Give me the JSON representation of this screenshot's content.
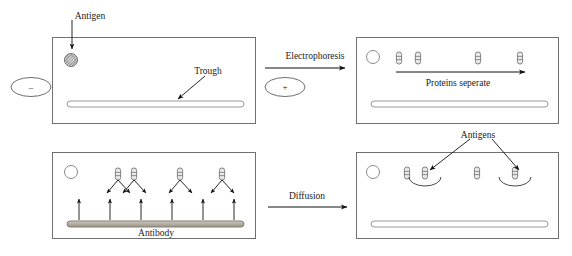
{
  "diagram": {
    "colors": {
      "stroke": "#3f3f3f",
      "panel_border": "#707070",
      "arrow": "#111111",
      "antibody_fill": "#b8b2a8",
      "well_fill": "#cfcfcf",
      "protein_fill": "#e8e8e8",
      "background": "#ffffff"
    },
    "panels": [
      {
        "id": "panel-top-left",
        "x": 52,
        "y": 37,
        "w": 203,
        "h": 86,
        "well": {
          "cx": 71,
          "cy": 60,
          "r": 6.5,
          "style": "hatched"
        },
        "trough": {
          "x": 67,
          "y": 101,
          "w": 177,
          "h": 6,
          "fill": "none"
        },
        "proteins": [],
        "arcs": []
      },
      {
        "id": "panel-top-right",
        "x": 356,
        "y": 37,
        "w": 202,
        "h": 86,
        "well": {
          "cx": 373,
          "cy": 57,
          "r": 6.5,
          "style": "plain"
        },
        "trough": {
          "x": 371,
          "y": 101,
          "w": 177,
          "h": 6,
          "fill": "none"
        },
        "proteins": [
          {
            "cx": 399,
            "cy": 58
          },
          {
            "cx": 418,
            "cy": 58
          },
          {
            "cx": 478,
            "cy": 58
          },
          {
            "cx": 520,
            "cy": 58
          }
        ],
        "arcs": []
      },
      {
        "id": "panel-bottom-left",
        "x": 52,
        "y": 152,
        "w": 203,
        "h": 86,
        "well": {
          "cx": 71,
          "cy": 172,
          "r": 6.5,
          "style": "plain"
        },
        "trough": {
          "x": 67,
          "y": 221,
          "w": 177,
          "h": 6,
          "fill": "antibody"
        },
        "proteins": [
          {
            "cx": 118,
            "cy": 174
          },
          {
            "cx": 134,
            "cy": 174
          },
          {
            "cx": 180,
            "cy": 174
          },
          {
            "cx": 222,
            "cy": 174
          }
        ],
        "arcs": []
      },
      {
        "id": "panel-bottom-right",
        "x": 356,
        "y": 152,
        "w": 202,
        "h": 86,
        "well": {
          "cx": 373,
          "cy": 172,
          "r": 6.5,
          "style": "plain"
        },
        "trough": {
          "x": 371,
          "y": 221,
          "w": 177,
          "h": 6,
          "fill": "none"
        },
        "proteins": [
          {
            "cx": 407,
            "cy": 173
          },
          {
            "cx": 425,
            "cy": 173
          },
          {
            "cx": 477,
            "cy": 173
          },
          {
            "cx": 515,
            "cy": 173
          }
        ],
        "arcs": [
          {
            "cx": 425,
            "cy": 186,
            "rx": 16,
            "ry": 9
          },
          {
            "cx": 515,
            "cy": 186,
            "rx": 16,
            "ry": 9
          }
        ]
      }
    ],
    "electrodes": [
      {
        "id": "electrode-negative",
        "sign": "–",
        "cx": 31,
        "cy": 87,
        "rx": 20,
        "ry": 9.5
      },
      {
        "id": "electrode-positive",
        "sign": "+",
        "cx": 285,
        "cy": 87,
        "rx": 20,
        "ry": 9.5
      }
    ],
    "labels": {
      "antigen": {
        "text": "Antigen",
        "x": 90,
        "y": 12
      },
      "trough": {
        "text": "Trough",
        "x": 208,
        "y": 67
      },
      "electrophoresis": {
        "text": "Electrophoresis",
        "x": 315,
        "y": 52
      },
      "proteins_separate": {
        "text": "Proteins seperate",
        "x": 458,
        "y": 79
      },
      "antibody": {
        "text": "Antibody",
        "x": 156,
        "y": 229
      },
      "diffusion": {
        "text": "Diffusion",
        "x": 307,
        "y": 192
      },
      "antigens": {
        "text": "Antigens",
        "x": 478,
        "y": 131
      }
    },
    "process_arrows": [
      {
        "id": "electrophoresis-arrow",
        "x1": 265,
        "y1": 68,
        "x2": 345,
        "y2": 68
      },
      {
        "id": "diffusion-arrow",
        "x1": 268,
        "y1": 207,
        "x2": 347,
        "y2": 207
      },
      {
        "id": "proteins-separate-arrow",
        "x1": 396,
        "y1": 72,
        "x2": 525,
        "y2": 72
      }
    ],
    "leader_arrows": [
      {
        "id": "antigen-leader",
        "x1": 72,
        "y1": 20,
        "x2": 72,
        "y2": 49
      },
      {
        "id": "trough-leader",
        "x1": 205,
        "y1": 76,
        "x2": 178,
        "y2": 99
      },
      {
        "id": "antigens-leader-left",
        "x1": 470,
        "y1": 139,
        "x2": 430,
        "y2": 170
      },
      {
        "id": "antigens-leader-right",
        "x1": 492,
        "y1": 139,
        "x2": 519,
        "y2": 170
      }
    ],
    "diffusion_arrows_down": [
      {
        "x1": 118,
        "y1": 180,
        "x2": 107,
        "y2": 193
      },
      {
        "x1": 118,
        "y1": 180,
        "x2": 130,
        "y2": 193
      },
      {
        "x1": 134,
        "y1": 180,
        "x2": 123,
        "y2": 193
      },
      {
        "x1": 134,
        "y1": 180,
        "x2": 146,
        "y2": 193
      },
      {
        "x1": 180,
        "y1": 180,
        "x2": 169,
        "y2": 193
      },
      {
        "x1": 180,
        "y1": 180,
        "x2": 192,
        "y2": 193
      },
      {
        "x1": 222,
        "y1": 180,
        "x2": 211,
        "y2": 193
      },
      {
        "x1": 222,
        "y1": 180,
        "x2": 234,
        "y2": 193
      }
    ],
    "diffusion_arrows_up": [
      {
        "x1": 79,
        "y1": 220,
        "x2": 79,
        "y2": 199
      },
      {
        "x1": 110,
        "y1": 220,
        "x2": 110,
        "y2": 199
      },
      {
        "x1": 141,
        "y1": 220,
        "x2": 141,
        "y2": 199
      },
      {
        "x1": 172,
        "y1": 220,
        "x2": 172,
        "y2": 199
      },
      {
        "x1": 203,
        "y1": 220,
        "x2": 203,
        "y2": 199
      },
      {
        "x1": 234,
        "y1": 220,
        "x2": 234,
        "y2": 199
      }
    ]
  }
}
